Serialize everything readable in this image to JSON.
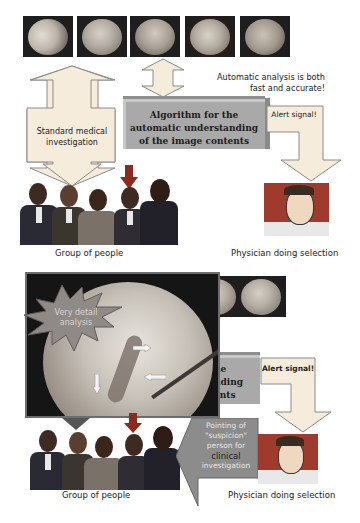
{
  "top_section": {
    "thumbnails": [
      {
        "id": "endoscopy-frame-1",
        "selected": false
      },
      {
        "id": "endoscopy-frame-2",
        "selected": false
      },
      {
        "id": "endoscopy-frame-3",
        "selected": false
      },
      {
        "id": "endoscopy-frame-4",
        "selected": true
      },
      {
        "id": "endoscopy-frame-5",
        "selected": false
      }
    ],
    "annotation": "Automatic analysis is both fast and accurate!",
    "annotation_line1": "Automatic analysis is both",
    "annotation_line2": "fast and accurate!",
    "standard_label_line1": "Standard medical",
    "standard_label_line2": "investigation",
    "algorithm_line1": "Algorithm for the",
    "algorithm_line2": "automatic understanding",
    "algorithm_line3": "of the image contents",
    "alert_label": "Alert signal!",
    "group_caption": "Group of people",
    "physician_caption": "Physician doing selection"
  },
  "bottom_section": {
    "burst_line1": "Very detail",
    "burst_line2": "analysis",
    "algorithm_partial_line1": "he",
    "algorithm_partial_line2": "nding",
    "algorithm_partial_line3": "ents",
    "alert_label": "Alert signal!",
    "pointing_line1": "Pointing of",
    "pointing_line2": "\"suspicion\"",
    "pointing_line3": "person for",
    "pointing_line4": "clinical",
    "pointing_line5": "investigation",
    "group_caption": "Group of people",
    "physician_caption": "Physician doing selection"
  },
  "colors": {
    "arrow_fill": "#f6ecdc",
    "arrow_stroke": "#8a8a8a",
    "algorithm_box": "#a9a9a9",
    "red_arrow": "#8b2a1f",
    "burst_fill": "#8f8a86",
    "pointing_arrow": "#8c8c8c"
  }
}
